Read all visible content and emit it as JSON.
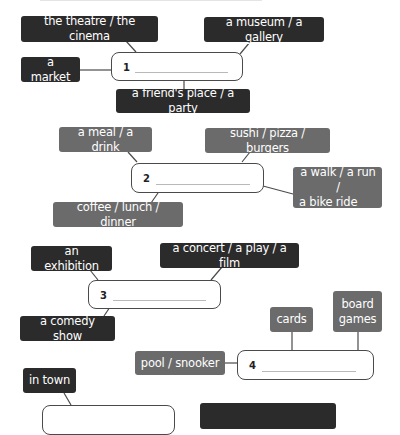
{
  "exercise": {
    "groups": [
      {
        "number": "1",
        "prompts": [
          "the theatre / the cinema",
          "a museum / a gallery",
          "a market",
          "a friend's place / a party"
        ],
        "style": "dark"
      },
      {
        "number": "2",
        "prompts": [
          "a meal / a drink",
          "sushi / pizza / burgers",
          "a walk / a run / a bike ride",
          "coffee / lunch / dinner"
        ],
        "style": "grey"
      },
      {
        "number": "3",
        "prompts": [
          "an exhibition",
          "a concert / a play / a film",
          "a comedy show"
        ],
        "style": "dark"
      },
      {
        "number": "4",
        "prompts": [
          "cards",
          "board games",
          "pool / snooker"
        ],
        "style": "grey"
      },
      {
        "number": "",
        "prompts": [
          "in town"
        ],
        "style": "dark"
      }
    ]
  },
  "labels": {
    "g1_theatre": "the theatre / the cinema",
    "g1_museum": "a museum / a gallery",
    "g1_market": "a market",
    "g1_friend": "a friend's place / a party",
    "g1_num": "1",
    "g2_meal": "a meal / a drink",
    "g2_sushi": "sushi / pizza / burgers",
    "g2_walk_l1": "a walk / a run /",
    "g2_walk_l2": "a bike ride",
    "g2_coffee": "coffee / lunch / dinner",
    "g2_num": "2",
    "g3_exhibition": "an exhibition",
    "g3_concert": "a concert / a play / a film",
    "g3_comedy": "a comedy show",
    "g3_num": "3",
    "g4_cards": "cards",
    "g4_board_l1": "board",
    "g4_board_l2": "games",
    "g4_pool": "pool / snooker",
    "g4_num": "4",
    "g5_town": "in town"
  },
  "colors": {
    "dark_tag": "#2b2b2b",
    "grey_tag": "#6b6b6b",
    "border": "#4a4a4a"
  }
}
